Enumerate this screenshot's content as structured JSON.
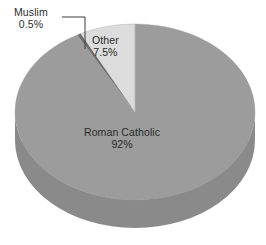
{
  "background_color": "#ffffff",
  "chart_data": {
    "type": "pie",
    "title": "",
    "subtitle": "",
    "xlabel": "",
    "ylabel": "",
    "legend_position": "none",
    "grid": false,
    "three_d": true,
    "start_angle_deg": 0,
    "direction": "clockwise",
    "categories": [
      "Roman Catholic",
      "Other",
      "Muslim"
    ],
    "values": [
      92,
      7.5,
      0.5
    ],
    "units": "percent",
    "slice_colors": [
      "#9c9c9c",
      "#dcdcdc",
      "#6e6e6e"
    ],
    "slices": [
      {
        "label": "Roman Catholic",
        "value": 92,
        "value_text": "92%",
        "color": "#9c9c9c",
        "side_color": "#8a8a8a",
        "label_placement": "inside"
      },
      {
        "label": "Other",
        "value": 7.5,
        "value_text": "7.5%",
        "color": "#dcdcdc",
        "side_color": "#c2c2c2",
        "label_placement": "inside"
      },
      {
        "label": "Muslim",
        "value": 0.5,
        "value_text": "0.5%",
        "color": "#6e6e6e",
        "side_color": "#5e5e5e",
        "label_placement": "outside-leader"
      }
    ],
    "annotations": [
      {
        "name": "muslim-leader-line",
        "from": "label Muslim",
        "to": "Muslim slice edge"
      }
    ]
  },
  "labels": {
    "muslim": {
      "name": "Muslim",
      "percent": "0.5%"
    },
    "other": {
      "name": "Other",
      "percent": "7.5%"
    },
    "roman_catholic": {
      "name": "Roman Catholic",
      "percent": "92%"
    }
  },
  "colors": {
    "slice_main": "#9c9c9c",
    "slice_main_side": "#8a8a8a",
    "slice_other": "#dcdcdc",
    "slice_other_side": "#c4c4c4",
    "slice_muslim": "#6e6e6e",
    "text": "#2b2b2b",
    "leader_line": "#3a3a3a",
    "background": "#ffffff"
  }
}
